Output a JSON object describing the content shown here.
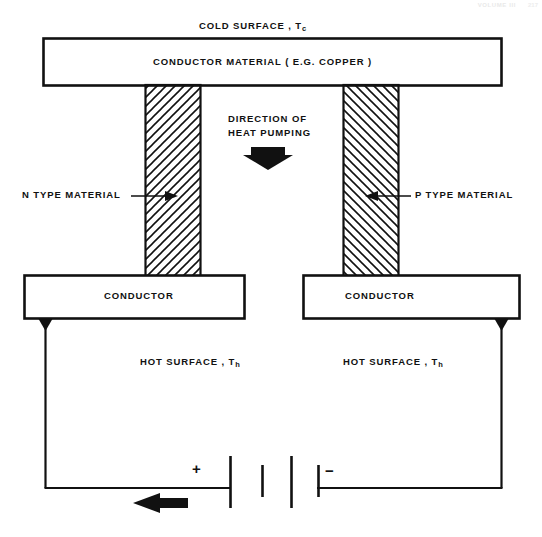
{
  "document": {
    "header_text": "VOLUME III",
    "page_number": "217"
  },
  "diagram": {
    "labels": {
      "cold_surface": "COLD SURFACE , T",
      "cold_surface_sub": "c",
      "conductor_material": "CONDUCTOR MATERIAL ( E.G. COPPER )",
      "direction_line1": "DIRECTION OF",
      "direction_line2": "HEAT PUMPING",
      "n_type_material": "N  TYPE MATERIAL",
      "p_type_material": "P TYPE MATERIAL",
      "conductor_left": "CONDUCTOR",
      "conductor_right": "CONDUCTOR",
      "hot_surface_left": "HOT SURFACE , T",
      "hot_surface_left_sub": "h",
      "hot_surface_right": "HOT SURFACE , T",
      "hot_surface_right_sub": "h",
      "battery_positive": "+",
      "battery_negative": "−"
    },
    "icons": {
      "heat_pumping_arrow": "down-arrow-icon",
      "current_flow_arrow": "left-arrow-icon",
      "n_leader_arrow": "right-arrowhead-icon",
      "p_leader_arrow": "left-arrowhead-icon",
      "battery": "battery-symbol-icon",
      "terminal_left": "terminal-node-icon",
      "terminal_right": "terminal-node-icon"
    },
    "colors": {
      "stroke": "#111111",
      "fill": "#ffffff",
      "hatch": "#111111",
      "background": "#ffffff"
    },
    "geometry": {
      "cold_plate": {
        "x": 43,
        "y": 38,
        "w": 458,
        "h": 47
      },
      "n_pillar": {
        "x": 145,
        "y": 85,
        "w": 56,
        "h": 193,
        "hatch": "forward"
      },
      "p_pillar": {
        "x": 343,
        "y": 85,
        "w": 56,
        "h": 193,
        "hatch": "backward"
      },
      "conductor_left_box": {
        "x": 24,
        "y": 275,
        "w": 221,
        "h": 44
      },
      "conductor_right_box": {
        "x": 303,
        "y": 275,
        "w": 217,
        "h": 44
      },
      "circuit": {
        "left_x": 45,
        "right_x": 502,
        "bottom_y": 488
      },
      "battery_plates_x": [
        230,
        262,
        291,
        318
      ]
    }
  }
}
